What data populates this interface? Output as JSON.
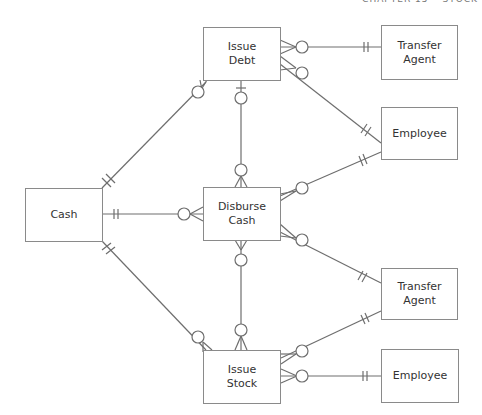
{
  "header": {
    "text": "CHAPTER 15 • STOCK"
  },
  "entities": {
    "issue_debt": {
      "line1": "Issue",
      "line2": "Debt"
    },
    "transfer_agent_top": {
      "line1": "Transfer",
      "line2": "Agent"
    },
    "employee_top": {
      "label": "Employee"
    },
    "cash": {
      "label": "Cash"
    },
    "disburse_cash": {
      "line1": "Disburse",
      "line2": "Cash"
    },
    "transfer_agent_bottom": {
      "line1": "Transfer",
      "line2": "Agent"
    },
    "issue_stock": {
      "line1": "Issue",
      "line2": "Stock"
    },
    "employee_bottom": {
      "label": "Employee"
    }
  },
  "relationships": [
    {
      "from": "Issue Debt",
      "to": "Transfer Agent",
      "from_card": "zero-or-many",
      "to_card": "one-and-only-one"
    },
    {
      "from": "Issue Debt",
      "to": "Employee",
      "from_card": "zero-or-many",
      "to_card": "one-and-only-one"
    },
    {
      "from": "Cash",
      "to": "Issue Debt",
      "from_card": "one-and-only-one",
      "to_card": "zero-or-many"
    },
    {
      "from": "Issue Debt",
      "to": "Disburse Cash",
      "from_card": "zero-or-one",
      "to_card": "zero-or-many"
    },
    {
      "from": "Cash",
      "to": "Disburse Cash",
      "from_card": "one-and-only-one",
      "to_card": "zero-or-many"
    },
    {
      "from": "Disburse Cash",
      "to": "Employee",
      "from_card": "zero-or-many",
      "to_card": "one-and-only-one"
    },
    {
      "from": "Disburse Cash",
      "to": "Transfer Agent",
      "from_card": "zero-or-many",
      "to_card": "one-and-only-one"
    },
    {
      "from": "Disburse Cash",
      "to": "Issue Stock",
      "from_card": "zero-or-many",
      "to_card": "zero-or-many"
    },
    {
      "from": "Cash",
      "to": "Issue Stock",
      "from_card": "one-and-only-one",
      "to_card": "zero-or-many"
    },
    {
      "from": "Issue Stock",
      "to": "Transfer Agent",
      "from_card": "zero-or-many",
      "to_card": "one-and-only-one"
    },
    {
      "from": "Issue Stock",
      "to": "Employee",
      "from_card": "zero-or-many",
      "to_card": "one-and-only-one"
    }
  ],
  "colors": {
    "line": "#6e6e6e",
    "box_border": "#8a8a8a",
    "text": "#333333"
  }
}
